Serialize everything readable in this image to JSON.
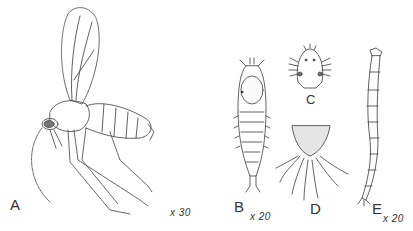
{
  "plate": {
    "description": "Scientific line illustration of a midge (adult) and its immature stages",
    "figures": [
      {
        "id": "A",
        "label": "A",
        "subject": "adult midge, lateral view with wing raised",
        "scale": "x 30"
      },
      {
        "id": "B",
        "label": "B",
        "subject": "pupa / larva, dorsal view",
        "scale": "x 20"
      },
      {
        "id": "C",
        "label": "C",
        "subject": "head capsule",
        "scale": ""
      },
      {
        "id": "D",
        "label": "D",
        "subject": "terminal segment with appendages",
        "scale": ""
      },
      {
        "id": "E",
        "label": "E",
        "subject": "larva, elongate segmented body",
        "scale": "x 20"
      }
    ]
  },
  "labels": {
    "A": "A",
    "B": "B",
    "C": "C",
    "D": "D",
    "E": "E",
    "scale_A": "x 30",
    "scale_B": "x 20",
    "scale_E": "x 20"
  },
  "colors": {
    "ink": "#3a3a3a",
    "paper": "#ffffff",
    "shade": "#cfcfcf"
  }
}
